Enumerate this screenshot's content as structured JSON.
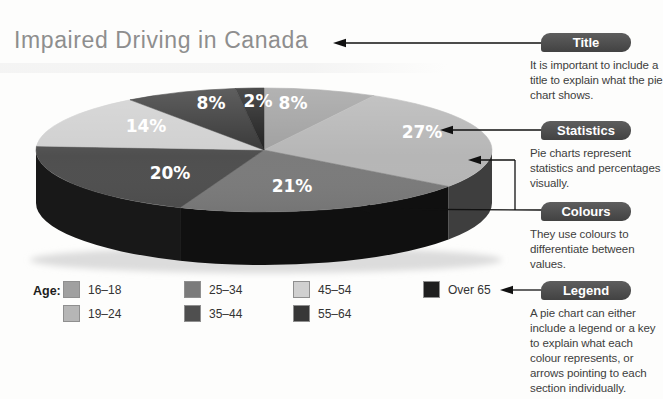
{
  "page": {
    "title": "Impaired Driving in Canada"
  },
  "chart_data": {
    "type": "pie",
    "style": "3d",
    "title": "Impaired Driving in Canada",
    "unit": "%",
    "legend_title": "Age:",
    "legend_position": "bottom",
    "slices": [
      {
        "label": "16–18",
        "value": 8,
        "color": "#a0a0a0"
      },
      {
        "label": "19–24",
        "value": 27,
        "color": "#b6b6b6"
      },
      {
        "label": "25–34",
        "value": 21,
        "color": "#7b7b7b"
      },
      {
        "label": "35–44",
        "value": 20,
        "color": "#4f4f4f"
      },
      {
        "label": "45–54",
        "value": 14,
        "color": "#d0d0d0"
      },
      {
        "label": "55–64",
        "value": 8,
        "color": "#373737"
      },
      {
        "label": "Over 65",
        "value": 2,
        "color": "#1f1f1f"
      }
    ]
  },
  "annotations": [
    {
      "badge": "Title",
      "text": "It is important to include a title to explain what the pie chart shows."
    },
    {
      "badge": "Statistics",
      "text": "Pie charts represent statistics and percentages visually."
    },
    {
      "badge": "Colours",
      "text": "They use colours to differentiate between values."
    },
    {
      "badge": "Legend",
      "text": "A pie chart can either include a legend or a key to explain what each colour represents, or arrows pointing to each section individually."
    }
  ],
  "colors": {
    "badge_bg": "#4d4d4d",
    "badge_text": "#ffffff",
    "title_text": "#8e8e8e",
    "body_text": "#3d3d3d",
    "arrow": "#111111",
    "pie_label_text": "#ffffff"
  }
}
